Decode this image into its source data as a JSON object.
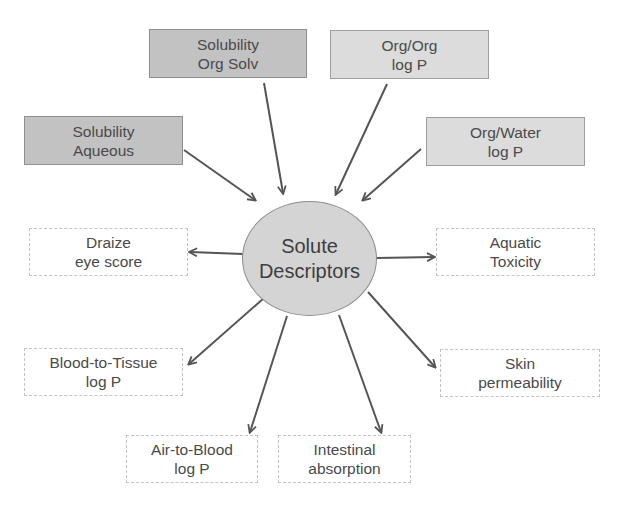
{
  "center": {
    "line1": "Solute",
    "line2": "Descriptors"
  },
  "inputs": [
    {
      "id": "solubility-org-solv",
      "line1": "Solubility",
      "line2": "Org Solv",
      "shade": "dark"
    },
    {
      "id": "org-org-log-p",
      "line1": "Org/Org",
      "line2": "log P",
      "shade": "light"
    },
    {
      "id": "solubility-aqueous",
      "line1": "Solubility",
      "line2": "Aqueous",
      "shade": "dark"
    },
    {
      "id": "org-water-log-p",
      "line1": "Org/Water",
      "line2": "log P",
      "shade": "light"
    }
  ],
  "outputs": [
    {
      "id": "draize-eye-score",
      "line1": "Draize",
      "line2": "eye score"
    },
    {
      "id": "aquatic-toxicity",
      "line1": "Aquatic",
      "line2": "Toxicity"
    },
    {
      "id": "blood-to-tissue-log-p",
      "line1": "Blood-to-Tissue",
      "line2": "log P"
    },
    {
      "id": "skin-permeability",
      "line1": "Skin",
      "line2": "permeability"
    },
    {
      "id": "air-to-blood-log-p",
      "line1": "Air-to-Blood",
      "line2": "log P"
    },
    {
      "id": "intestinal-absorption",
      "line1": "Intestinal",
      "line2": "absorption"
    }
  ],
  "colors": {
    "input_dark_fill": "#c2c2c2",
    "input_light_fill": "#dcdcdc",
    "circle_fill": "#d4d4d4",
    "arrow": "#555555",
    "output_border": "#c4c4c4"
  }
}
